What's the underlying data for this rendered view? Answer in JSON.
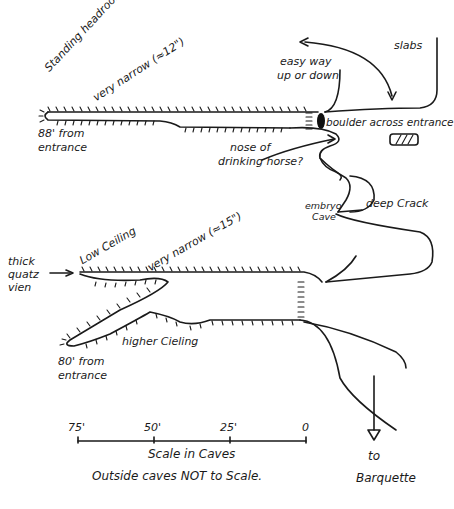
{
  "diagram": {
    "type": "hand-drawn cave survey sketch",
    "upper_passage": {
      "labels": {
        "standing_headroom": "Standing headroom.",
        "very_narrow": "very narrow (≈12\")",
        "end_distance_1": "88' from",
        "end_distance_2": "entrance",
        "nose_1": "nose of",
        "nose_2": "drinking horse?"
      }
    },
    "entrance": {
      "easy_way_1": "easy way",
      "easy_way_2": "up or down",
      "slabs": "slabs",
      "boulder": "boulder across entrance"
    },
    "middle": {
      "embryo_1": "embryo",
      "embryo_2": "Cave",
      "deep_crack": "deep Crack"
    },
    "lower_passage": {
      "labels": {
        "thick_1": "thick",
        "thick_2": "quatz",
        "thick_3": "vien",
        "low_ceiling": "Low Ceiling",
        "very_narrow": "very narrow (≈15\")",
        "higher_ceiling": "higher Cieling",
        "end_distance_1": "80' from",
        "end_distance_2": "entrance"
      }
    },
    "scale": {
      "ticks": [
        "75'",
        "50'",
        "25'",
        "0"
      ],
      "caption": "Scale in Caves",
      "note": "Outside caves NOT to Scale."
    },
    "destination": {
      "line1": "to",
      "line2": "Barquette"
    }
  }
}
